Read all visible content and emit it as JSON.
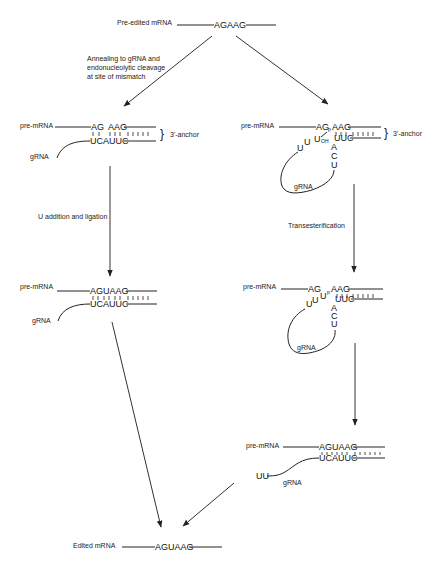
{
  "top": {
    "label": "Pre-edited mRNA",
    "sequence": "AGAAG"
  },
  "step1": {
    "label_lines": [
      "Annealing to gRNA and",
      "endonucleolytic cleavage",
      "at site of mismatch"
    ]
  },
  "left_panel1": {
    "pre_label": "pre-mRNA",
    "seq_top_left": "AG",
    "seq_top_right": "AAG",
    "seq_bottom": "UCAUUC",
    "grna_label": "gRNA",
    "anchor_label": "3'-anchor"
  },
  "left_step": {
    "label": "U addition and ligation"
  },
  "left_panel2": {
    "pre_label": "pre-mRNA",
    "seq_top": "AGUAAG",
    "seq_bottom": "UCAUUC",
    "grna_label": "gRNA"
  },
  "right_panel1": {
    "pre_label": "pre-mRNA",
    "seq_top_left": "AG",
    "p": "p",
    "seq_top_right": "AAG",
    "uoh": "U",
    "oh": "OH",
    "loop_u": [
      "U",
      "U"
    ],
    "seq_bottom": "UUC",
    "stem": [
      "A",
      "C",
      "U"
    ],
    "grna_label": "gRNA",
    "anchor_label": "3'-anchor"
  },
  "right_step": {
    "label": "Transesterification"
  },
  "right_panel2": {
    "pre_label": "pre-mRNA",
    "seq_top_left": "AG",
    "loop_u": [
      "U",
      "U",
      "U"
    ],
    "p": "p",
    "seq_top_right": "AAG",
    "seq_bottom": "UUC",
    "stem": [
      "A",
      "C",
      "U"
    ],
    "grna_label": "gRNA"
  },
  "right_panel3": {
    "pre_label": "pre-mRNA",
    "seq_top": "AGUAAG",
    "seq_bottom": "UCAUUC",
    "uu": "UU",
    "grna_label": "gRNA"
  },
  "bottom": {
    "label": "Edited mRNA",
    "sequence": "AGUAAG"
  }
}
